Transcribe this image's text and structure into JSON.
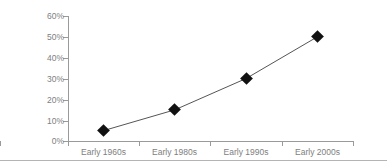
{
  "chart_data": {
    "type": "line",
    "title": "",
    "subtitle": "",
    "xlabel": "",
    "ylabel": "",
    "categories": [
      "Early 1960s",
      "Early 1980s",
      "Early 1990s",
      "Early 2000s"
    ],
    "values": [
      5,
      15,
      30,
      50
    ],
    "value_suffix": "%",
    "series": [
      {
        "name": "",
        "values": [
          5,
          15,
          30,
          50
        ],
        "marker": "diamond",
        "marker_color": "#111111",
        "line_color": "#555555"
      }
    ],
    "ylim": [
      0,
      60
    ],
    "ytick_values": [
      0,
      10,
      20,
      30,
      40,
      50,
      60
    ],
    "ytick_labels": [
      "0%",
      "10%",
      "20%",
      "30%",
      "40%",
      "50%",
      "60%"
    ],
    "grid": false,
    "legend": false,
    "legend_position": "none",
    "annotations": []
  },
  "axes": {
    "y_labels": [
      "60%",
      "50%",
      "40%",
      "30%",
      "20%",
      "10%",
      "0%"
    ],
    "x_labels": [
      "Early 1960s",
      "Early 1980s",
      "Early 1990s",
      "Early 2000s"
    ]
  },
  "colors": {
    "axis": "#9a9a9a",
    "tick_text": "#808080",
    "marker": "#111111",
    "line": "#555555",
    "rule": "#b4b4b4",
    "background": "#ffffff"
  }
}
